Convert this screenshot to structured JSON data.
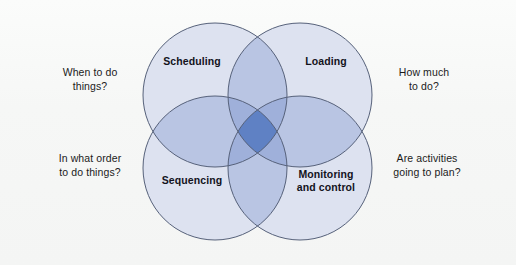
{
  "figure": {
    "background_color": "#f8f9f8"
  },
  "diagram": {
    "type": "venn-4-circle",
    "circle_fill": "#dde2f0",
    "overlap_two_fill": "#b9c5e3",
    "overlap_center_fill": "#5f81c4",
    "stroke_color": "#56617a",
    "circles": [
      {
        "id": "scheduling",
        "label": "Scheduling",
        "position": "top-left",
        "cx": 215,
        "cy": 95,
        "r": 72,
        "question": "When to do\nthings?",
        "question_side": "left"
      },
      {
        "id": "loading",
        "label": "Loading",
        "position": "top-right",
        "cx": 300,
        "cy": 95,
        "r": 72,
        "question": "How much\nto do?",
        "question_side": "right"
      },
      {
        "id": "sequencing",
        "label": "Sequencing",
        "position": "bottom-left",
        "cx": 215,
        "cy": 168,
        "r": 72,
        "question": "In what order\nto do things?",
        "question_side": "left"
      },
      {
        "id": "monitoring",
        "label": "Monitoring\nand control",
        "position": "bottom-right",
        "cx": 300,
        "cy": 168,
        "r": 72,
        "question": "Are activities\ngoing to plan?",
        "question_side": "right"
      }
    ]
  },
  "labels": {
    "scheduling": "Scheduling",
    "loading": "Loading",
    "sequencing": "Sequencing",
    "monitoring": "Monitoring\nand control"
  },
  "questions": {
    "when": "When to do\nthings?",
    "how_much": "How much\nto do?",
    "order": "In what order\nto do things?",
    "are_activities": "Are activities\ngoing to plan?"
  }
}
